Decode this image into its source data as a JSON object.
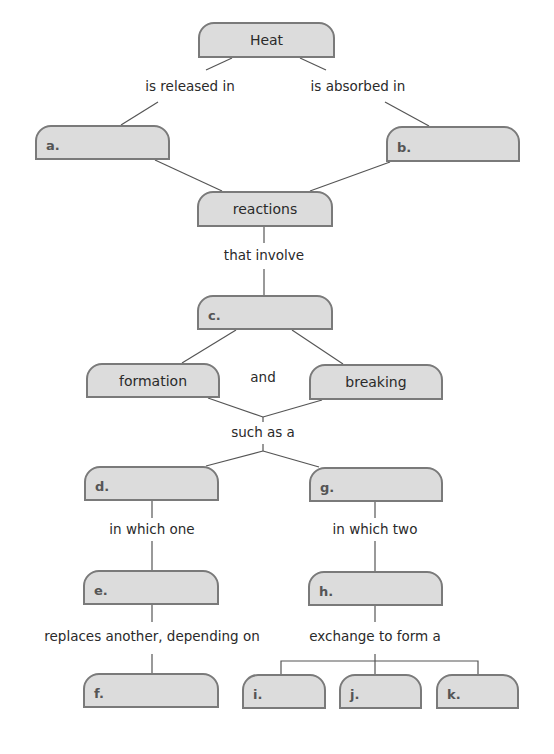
{
  "diagram": {
    "type": "concept map",
    "nodes": {
      "heat": "Heat",
      "a": "a.",
      "b": "b.",
      "reactions": "reactions",
      "c": "c.",
      "formation": "formation",
      "breaking": "breaking",
      "d": "d.",
      "g": "g.",
      "e": "e.",
      "h": "h.",
      "f": "f.",
      "i": "i.",
      "j": "j.",
      "k": "k."
    },
    "links": {
      "released": "is released in",
      "absorbed": "is absorbed in",
      "involve": "that involve",
      "and": "and",
      "such_as": "such as a",
      "which_one": "in which one",
      "which_two": "in which two",
      "replaces": "replaces another, depending on",
      "exchange": "exchange to form a"
    },
    "colors": {
      "node_fill": "#dcdcdc",
      "node_border": "#7a7a7a",
      "line": "#555555"
    }
  }
}
